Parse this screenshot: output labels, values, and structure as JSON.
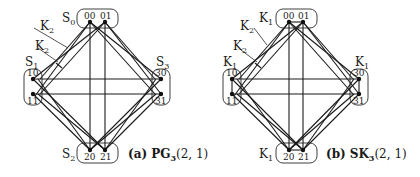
{
  "panels": [
    {
      "id": "a",
      "caption_prefix": "(a)",
      "caption_name": "PG",
      "caption_sub": "3",
      "caption_args": "(2, 1)",
      "nodes": {
        "n00": {
          "label": "00",
          "x": 90,
          "y": 22
        },
        "n01": {
          "label": "01",
          "x": 105,
          "y": 22
        },
        "n10": {
          "label": "10",
          "x": 33,
          "y": 79
        },
        "n11": {
          "label": "11",
          "x": 33,
          "y": 94
        },
        "n20": {
          "label": "20",
          "x": 90,
          "y": 150
        },
        "n21": {
          "label": "21",
          "x": 105,
          "y": 150
        },
        "n30": {
          "label": "30",
          "x": 161,
          "y": 79
        },
        "n31": {
          "label": "31",
          "x": 161,
          "y": 94
        }
      },
      "group_labels": {
        "top": {
          "main": "S",
          "sub": "0"
        },
        "left": {
          "main": "S",
          "sub": "1"
        },
        "bottom": {
          "main": "S",
          "sub": "2"
        },
        "right": {
          "main": "S",
          "sub": "3"
        }
      },
      "edge_labels": [
        {
          "main": "K",
          "sub": "2"
        },
        {
          "main": "K",
          "sub": "2"
        }
      ],
      "intra_group_edges": false
    },
    {
      "id": "b",
      "caption_prefix": "(b)",
      "caption_name": "SK",
      "caption_sub": "3",
      "caption_args": "(2, 1)",
      "nodes": {
        "n00": {
          "label": "00",
          "x": 289,
          "y": 22
        },
        "n01": {
          "label": "01",
          "x": 303,
          "y": 22
        },
        "n10": {
          "label": "10",
          "x": 232,
          "y": 79
        },
        "n11": {
          "label": "11",
          "x": 232,
          "y": 94
        },
        "n20": {
          "label": "20",
          "x": 289,
          "y": 150
        },
        "n21": {
          "label": "21",
          "x": 303,
          "y": 150
        },
        "n30": {
          "label": "30",
          "x": 359,
          "y": 79
        },
        "n31": {
          "label": "31",
          "x": 359,
          "y": 94
        }
      },
      "group_labels": {
        "top": {
          "main": "K",
          "sub": "1"
        },
        "left": {
          "main": "K",
          "sub": "1"
        },
        "bottom": {
          "main": "K",
          "sub": "1"
        },
        "right": {
          "main": "K",
          "sub": "1"
        }
      },
      "edge_labels": [
        {
          "main": "K",
          "sub": "2"
        },
        {
          "main": "K",
          "sub": "2"
        }
      ],
      "intra_group_edges": true
    }
  ]
}
